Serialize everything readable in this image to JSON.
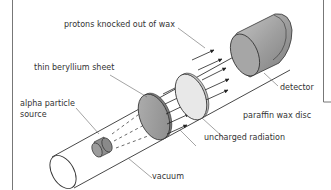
{
  "diagram": {
    "labels": {
      "protons": "protons knocked out of wax",
      "beryllium": "thin beryllium sheet",
      "alpha_line1": "alpha particle",
      "alpha_line2": "source",
      "detector": "detector",
      "paraffin": "paraffin wax disc",
      "uncharged": "uncharged radiation",
      "vacuum": "vacuum"
    },
    "colors": {
      "line": "#333333",
      "leader": "#666666",
      "disc_grey": "#9a9a9a",
      "disc_light": "#e6e6e6",
      "detector_grey": "#a8a8a8",
      "frame": "#777777"
    }
  }
}
